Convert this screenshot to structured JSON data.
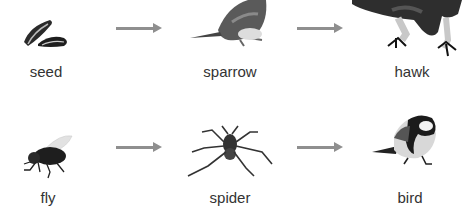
{
  "food_chains": [
    {
      "organisms": [
        {
          "label": "seed",
          "icon": "seed-icon"
        },
        {
          "label": "sparrow",
          "icon": "sparrow-icon"
        },
        {
          "label": "hawk",
          "icon": "hawk-icon"
        }
      ]
    },
    {
      "organisms": [
        {
          "label": "fly",
          "icon": "fly-icon"
        },
        {
          "label": "spider",
          "icon": "spider-icon"
        },
        {
          "label": "bird",
          "icon": "bird-icon"
        }
      ]
    }
  ],
  "colors": {
    "arrow": "#8f8f8f",
    "label": "#333333",
    "background": "#ffffff"
  }
}
